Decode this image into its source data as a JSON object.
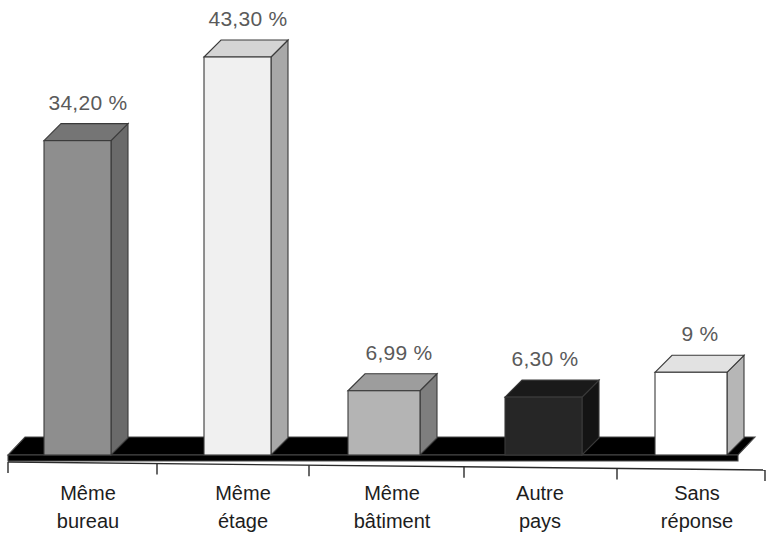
{
  "chart_data": {
    "type": "bar",
    "title": "",
    "subtitle": "",
    "xlabel": "",
    "ylabel": "",
    "grid": false,
    "legend": "none",
    "style": "3d-bar",
    "ylim": [
      0,
      47
    ],
    "categories": [
      "Même bureau",
      "Même étage",
      "Même bâtiment",
      "Autre pays",
      "Sans réponse"
    ],
    "category_lines": [
      [
        "Même",
        "bureau"
      ],
      [
        "Même",
        "étage"
      ],
      [
        "Même",
        "bâtiment"
      ],
      [
        "Autre",
        "pays"
      ],
      [
        "Sans",
        "réponse"
      ]
    ],
    "values": [
      34.2,
      43.3,
      6.99,
      6.3,
      9
    ],
    "data_labels": [
      "34,20 %",
      "43,30 %",
      "6,99 %",
      "6,30 %",
      "9 %"
    ],
    "bar_colors": [
      "#8e8e8e",
      "#f0f0f0",
      "#b4b4b4",
      "#262626",
      "#ffffff"
    ],
    "bar_top_colors": [
      "#757575",
      "#d4d4d4",
      "#9d9d9d",
      "#1a1a1a",
      "#e2e2e2"
    ],
    "bar_side_colors": [
      "#6a6a6a",
      "#a8a8a8",
      "#7e7e7e",
      "#141414",
      "#b6b6b6"
    ],
    "floor_color": "#c6c6c6",
    "floor_top_color": "#d2d2d2",
    "axis_color": "#2a2a2a",
    "label_color": "#5a5a5a",
    "category_label_color": "#1d1d1d"
  }
}
